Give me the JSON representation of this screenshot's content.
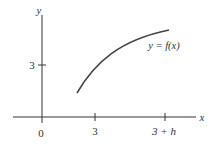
{
  "figure": {
    "type": "function-graph",
    "axes": {
      "x_label": "x",
      "y_label": "y",
      "origin_label": "0"
    },
    "x_ticks": [
      {
        "label": "3",
        "value": "3"
      },
      {
        "label": "3 + h",
        "value": "3+h"
      }
    ],
    "y_ticks": [
      {
        "label": "3",
        "value": "3"
      }
    ],
    "curve": {
      "label": "y = f(x)",
      "description": "increasing, concave-down curve starting above-left of x=3 and rising toward x=3+h"
    },
    "colors": {
      "axis": "#333333",
      "curve": "#444444",
      "text": "#333333"
    }
  }
}
